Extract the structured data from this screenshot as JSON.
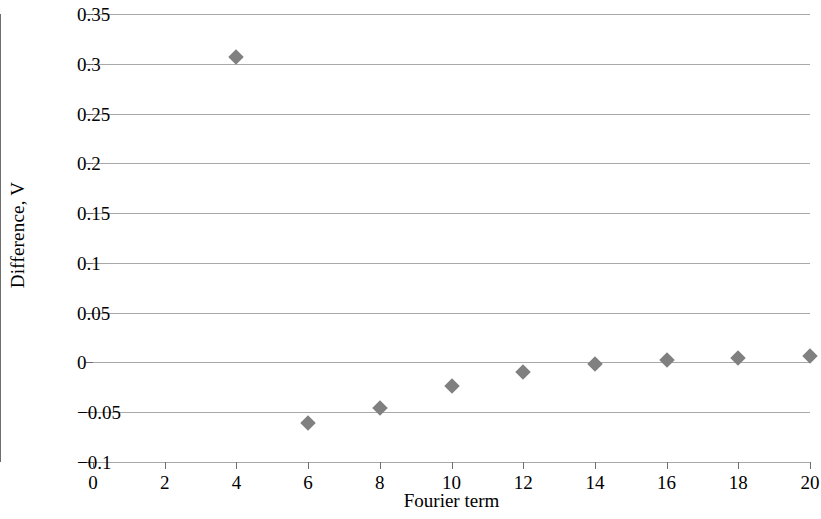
{
  "chart_data": {
    "type": "scatter",
    "title": "",
    "xlabel": "Fourier term",
    "ylabel": "Difference, V",
    "xlim": [
      0,
      20
    ],
    "ylim": [
      -0.1,
      0.35
    ],
    "xticks": [
      "0",
      "2",
      "4",
      "6",
      "8",
      "10",
      "12",
      "14",
      "16",
      "18",
      "20"
    ],
    "xtick_values": [
      0,
      2,
      4,
      6,
      8,
      10,
      12,
      14,
      16,
      18,
      20
    ],
    "yticks": [
      "−0.1",
      "−0.05",
      "0",
      "0.05",
      "0.1",
      "0.15",
      "0.2",
      "0.25",
      "0.3",
      "0.35"
    ],
    "ytick_values": [
      -0.1,
      -0.05,
      0,
      0.05,
      0.1,
      0.15,
      0.2,
      0.25,
      0.3,
      0.35
    ],
    "grid": "horizontal",
    "legend": "none",
    "marker_shape": "diamond",
    "marker_color": "#808080",
    "gridline_color": "#a8a8a8",
    "axis_color": "#6e6e6e",
    "series": [
      {
        "name": "Difference",
        "x": [
          4,
          6,
          8,
          10,
          12,
          14,
          16,
          18,
          20
        ],
        "values": [
          0.307,
          -0.061,
          -0.046,
          -0.024,
          -0.01,
          -0.002,
          0.002,
          0.004,
          0.006
        ]
      }
    ]
  }
}
